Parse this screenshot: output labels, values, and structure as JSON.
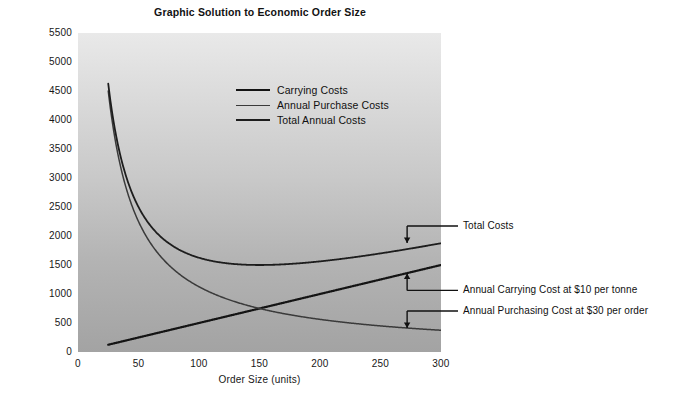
{
  "chart_data": {
    "type": "line",
    "title": "Graphic Solution to Economic Order Size",
    "xlabel": "Order Size (units)",
    "ylabel": "Cost ($)",
    "xlim": [
      0,
      300
    ],
    "ylim": [
      0,
      5500
    ],
    "xticks": [
      0,
      50,
      100,
      150,
      200,
      250,
      300
    ],
    "yticks": [
      0,
      500,
      1000,
      1500,
      2000,
      2500,
      3000,
      3500,
      4000,
      4500,
      5000,
      5500
    ],
    "grid": false,
    "legend_position": "upper-center",
    "x_tick_labels": [
      "0",
      "50",
      "100",
      "150",
      "200",
      "250",
      "300"
    ],
    "y_tick_labels": [
      "0",
      "500",
      "1000",
      "1500",
      "2000",
      "2500",
      "3000",
      "3500",
      "4000",
      "4500",
      "5000",
      "5500"
    ],
    "series": [
      {
        "name": "Carrying Costs",
        "legend_label": "Carrying Costs",
        "color": "#141414",
        "shape": "linear-increasing",
        "formula": "5 * Q",
        "x": [
          25,
          50,
          75,
          100,
          125,
          150,
          175,
          200,
          225,
          250,
          275,
          300
        ],
        "values": [
          125,
          250,
          375,
          500,
          625,
          750,
          875,
          1000,
          1125,
          1250,
          1375,
          1500
        ]
      },
      {
        "name": "Annual Purchase Costs",
        "legend_label": "Annual Purchase Costs",
        "color": "#3a3a3a",
        "shape": "hyperbolic-decreasing",
        "formula": "112500 / Q",
        "x": [
          25,
          50,
          75,
          100,
          125,
          150,
          175,
          200,
          225,
          250,
          275,
          300
        ],
        "values": [
          4500,
          2250,
          1500,
          1125,
          900,
          750,
          643,
          563,
          500,
          450,
          409,
          375
        ]
      },
      {
        "name": "Total Annual Costs",
        "legend_label": "Total Annual Costs",
        "color": "#1d1d1d",
        "shape": "u-curve",
        "formula": "5 * Q + 112500 / Q",
        "x": [
          25,
          50,
          75,
          100,
          125,
          150,
          175,
          200,
          225,
          250,
          275,
          300
        ],
        "values": [
          4625,
          2500,
          1875,
          1625,
          1525,
          1500,
          1518,
          1563,
          1625,
          1700,
          1784,
          1875
        ],
        "minimum": {
          "x": 150,
          "y": 1500
        }
      }
    ],
    "annotations": [
      {
        "label": "Total Costs",
        "target_series": "Total Annual Costs",
        "arrow_direction": "down",
        "at_x": 272,
        "at_y": 1880
      },
      {
        "label": "Annual Carrying Cost at $10 per tonne",
        "target_series": "Carrying Costs",
        "arrow_direction": "up",
        "at_x": 272,
        "at_y": 1355
      },
      {
        "label": "Annual Purchasing Cost at $30 per order",
        "target_series": "Annual Purchase Costs",
        "arrow_direction": "down",
        "at_x": 272,
        "at_y": 415
      }
    ],
    "intersection": {
      "x": 150,
      "y": 750,
      "note": "Carrying Costs meets Annual Purchase Costs"
    }
  },
  "legend": {
    "items": [
      {
        "label": "Carrying Costs"
      },
      {
        "label": "Annual Purchase Costs"
      },
      {
        "label": "Total Annual Costs"
      }
    ]
  },
  "colors": {
    "axis_text": "#171717",
    "line_dark": "#141414",
    "line_mid": "#3a3a3a",
    "plot_bg_top": "#e9e9e9",
    "plot_bg_bottom": "#a3a3a3",
    "page_bg": "#ffffff"
  }
}
